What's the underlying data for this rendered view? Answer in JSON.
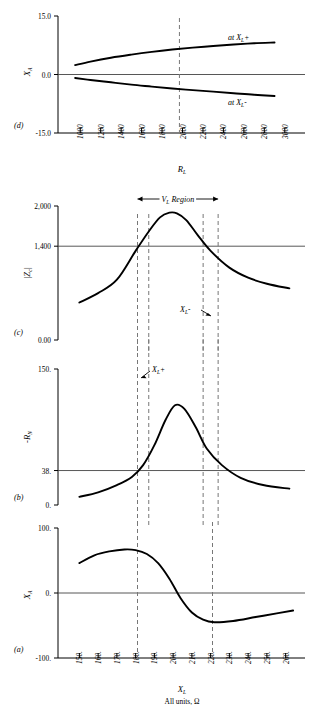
{
  "figure": {
    "panels": [
      {
        "id": "d",
        "letter": "(d)",
        "ylabel": "X",
        "ylabel_sub": "A",
        "xlabel": "R",
        "xlabel_sub": "L",
        "yticks": [
          "15.0",
          "0.0",
          "-15.0"
        ],
        "xticks": [
          "1000",
          "1200",
          "1400",
          "1600",
          "1800",
          "2000",
          "2200",
          "2400",
          "2600",
          "2800",
          "3000"
        ],
        "curve_labels": [
          {
            "text": "at X",
            "sub": "L",
            "sign": "+"
          },
          {
            "text": "at X",
            "sub": "L",
            "sign": "-"
          }
        ]
      },
      {
        "id": "c",
        "letter": "(c)",
        "ylabel": "|Z",
        "ylabel_sub": "c",
        "ylabel_tail": "|",
        "yticks": [
          "2,000",
          "1,400",
          "0.00"
        ],
        "region_label": "V",
        "region_label_sub": "L",
        "region_label_tail": "Region",
        "annotation": {
          "text": "X",
          "sub": "L",
          "sign": "-"
        }
      },
      {
        "id": "b",
        "letter": "(b)",
        "ylabel": "-R",
        "ylabel_sub": "N",
        "yticks": [
          "150.",
          "38.",
          "0."
        ],
        "annotation": {
          "text": "X",
          "sub": "L",
          "sign": "+"
        }
      },
      {
        "id": "a",
        "letter": "(a)",
        "ylabel": "X",
        "ylabel_sub": "A",
        "xlabel": "X",
        "xlabel_sub": "L",
        "yticks": [
          "100.",
          "0.",
          "-100."
        ],
        "xticks": [
          "150.",
          "160.",
          "170.",
          "180.",
          "190.",
          "200.",
          "210.",
          "220.",
          "230.",
          "240.",
          "250.",
          "260."
        ],
        "units_label": "All units, Ω"
      }
    ]
  },
  "chart_data": [
    {
      "type": "line",
      "panel": "d",
      "title": "",
      "xlabel": "R_L",
      "ylabel": "X_A",
      "xlim": [
        900,
        3100
      ],
      "ylim": [
        -15.0,
        15.0
      ],
      "xticks": [
        1000,
        1200,
        1400,
        1600,
        1800,
        2000,
        2200,
        2400,
        2600,
        2800,
        3000
      ],
      "yticks": [
        -15.0,
        0.0,
        15.0
      ],
      "grid": false,
      "zero_line": 0.0,
      "markers": [
        {
          "type": "vline",
          "x": 1970,
          "style": "dashed"
        }
      ],
      "series": [
        {
          "name": "at X_L+",
          "x": [
            950,
            1100,
            1300,
            1500,
            1700,
            1900,
            2100,
            2300,
            2500,
            2700,
            2900
          ],
          "values": [
            2.4,
            3.3,
            4.3,
            5.1,
            5.8,
            6.4,
            6.9,
            7.3,
            7.7,
            8.0,
            8.2
          ]
        },
        {
          "name": "at X_L-",
          "x": [
            950,
            1100,
            1300,
            1500,
            1700,
            1900,
            2100,
            2300,
            2500,
            2700,
            2900
          ],
          "values": [
            -0.9,
            -1.4,
            -2.0,
            -2.6,
            -3.1,
            -3.6,
            -4.0,
            -4.4,
            -4.8,
            -5.2,
            -5.5
          ]
        }
      ]
    },
    {
      "type": "line",
      "panel": "c",
      "title": "",
      "xlabel": "X_L",
      "ylabel": "|Z_c|",
      "xlim": [
        145,
        265
      ],
      "ylim": [
        0.0,
        2000
      ],
      "yticks": [
        0.0,
        1400,
        2000
      ],
      "grid": false,
      "hline": 1400,
      "region": {
        "label": "V_L Region",
        "from": 181,
        "to": 224
      },
      "markers": [
        {
          "type": "vline",
          "x": 181,
          "style": "dashed"
        },
        {
          "type": "vline",
          "x": 187,
          "style": "dashed",
          "label": "X_L+"
        },
        {
          "type": "vline",
          "x": 216,
          "style": "dashed",
          "label": "X_L-"
        },
        {
          "type": "vline",
          "x": 224,
          "style": "dashed"
        }
      ],
      "series": [
        {
          "name": "|Z_c|",
          "x": [
            150,
            160,
            170,
            180,
            187,
            193,
            198,
            202,
            207,
            213,
            220,
            230,
            240,
            250,
            262
          ],
          "values": [
            560,
            700,
            900,
            1330,
            1620,
            1830,
            1900,
            1890,
            1790,
            1570,
            1330,
            1080,
            930,
            840,
            770
          ]
        }
      ]
    },
    {
      "type": "line",
      "panel": "b",
      "title": "",
      "xlabel": "X_L",
      "ylabel": "-R_N",
      "xlim": [
        145,
        265
      ],
      "ylim": [
        0,
        150
      ],
      "yticks": [
        0,
        38,
        150
      ],
      "grid": false,
      "hline": 38,
      "markers": [
        {
          "type": "vline",
          "x": 181,
          "style": "dashed"
        },
        {
          "type": "vline",
          "x": 187,
          "style": "dashed",
          "label": "X_L+"
        },
        {
          "type": "vline",
          "x": 216,
          "style": "dashed"
        },
        {
          "type": "vline",
          "x": 224,
          "style": "dashed"
        }
      ],
      "series": [
        {
          "name": "-R_N",
          "x": [
            150,
            160,
            170,
            178,
            184,
            190,
            196,
            201,
            206,
            212,
            218,
            226,
            236,
            248,
            262
          ],
          "values": [
            9,
            14,
            22,
            31,
            44,
            66,
            94,
            110,
            106,
            86,
            62,
            44,
            30,
            22,
            18
          ]
        }
      ]
    },
    {
      "type": "line",
      "panel": "a",
      "title": "",
      "xlabel": "X_L",
      "ylabel": "X_A",
      "xlim": [
        145,
        265
      ],
      "ylim": [
        -100,
        100
      ],
      "xticks": [
        150,
        160,
        170,
        180,
        190,
        200,
        210,
        220,
        230,
        240,
        250,
        260
      ],
      "yticks": [
        -100,
        0,
        100
      ],
      "grid": false,
      "zero_line": 0,
      "markers": [
        {
          "type": "vline",
          "x": 181,
          "style": "dashed"
        },
        {
          "type": "vline",
          "x": 221,
          "style": "dashed"
        }
      ],
      "series": [
        {
          "name": "X_A",
          "x": [
            150,
            158,
            166,
            174,
            180,
            186,
            192,
            198,
            204,
            210,
            216,
            222,
            232,
            244,
            256,
            264
          ],
          "values": [
            46,
            58,
            64,
            67,
            66,
            60,
            46,
            22,
            -8,
            -30,
            -41,
            -45,
            -43,
            -37,
            -31,
            -27
          ]
        }
      ]
    }
  ]
}
